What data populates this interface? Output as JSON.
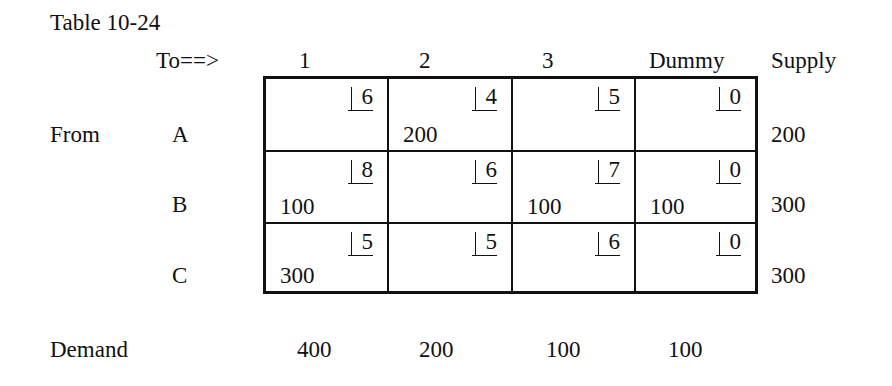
{
  "title": "Table 10-24",
  "header": {
    "to_label": "To==>",
    "columns": [
      "1",
      "2",
      "3",
      "Dummy"
    ],
    "supply_label": "Supply"
  },
  "from_label": "From",
  "rows": [
    {
      "name": "A",
      "costs": [
        "6",
        "4",
        "5",
        "0"
      ],
      "allocations": [
        "",
        "200",
        "",
        ""
      ],
      "supply": "200"
    },
    {
      "name": "B",
      "costs": [
        "8",
        "6",
        "7",
        "0"
      ],
      "allocations": [
        "100",
        "",
        "100",
        "100"
      ],
      "supply": "300"
    },
    {
      "name": "C",
      "costs": [
        "5",
        "5",
        "6",
        "0"
      ],
      "allocations": [
        "300",
        "",
        "",
        ""
      ],
      "supply": "300"
    }
  ],
  "demand": {
    "label": "Demand",
    "values": [
      "400",
      "200",
      "100",
      "100"
    ]
  }
}
